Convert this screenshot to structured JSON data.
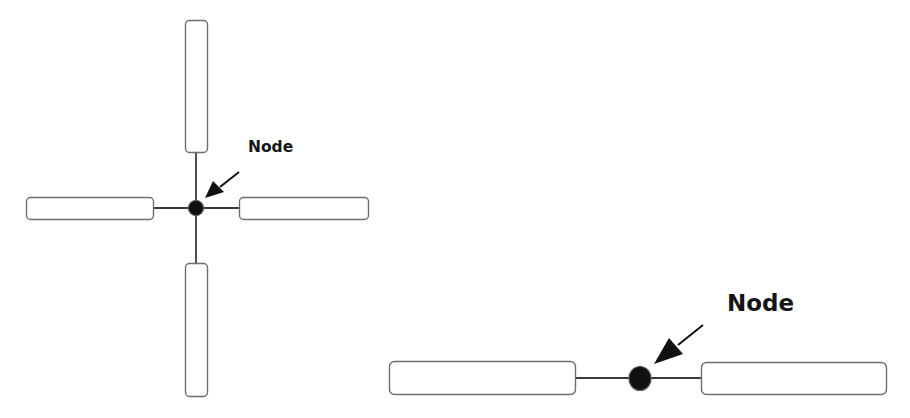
{
  "diagram": {
    "colors": {
      "background": "#ffffff",
      "bar_stroke": "#6e6e6e",
      "wire": "#3a3a3a",
      "node": "#111111",
      "arrow": "#111111",
      "label": "#151515"
    },
    "cross_junction": {
      "label": "Node",
      "node_center": [
        196,
        208
      ],
      "bars": [
        "top",
        "left",
        "right",
        "bottom"
      ]
    },
    "inline_junction": {
      "label": "Node",
      "node_center": [
        640,
        378
      ],
      "bars": [
        "left",
        "right"
      ]
    }
  }
}
